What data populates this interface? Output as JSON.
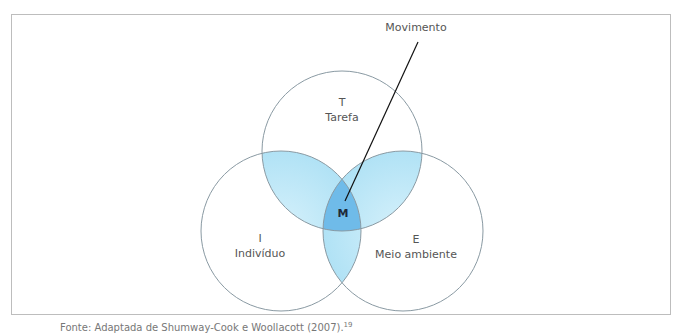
{
  "diagram": {
    "pointer_label": "Movimento",
    "center_label": "M",
    "circles": [
      {
        "id": "task",
        "letter": "T",
        "name": "Tarefa"
      },
      {
        "id": "individual",
        "letter": "I",
        "name": "Indivíduo"
      },
      {
        "id": "environment",
        "letter": "E",
        "name": "Meio ambiente"
      }
    ],
    "colors": {
      "circle_stroke": "#8a9aa3",
      "pair_overlap_fill": "#bfe8f7",
      "center_fill": "#6fbbe9",
      "pointer_line": "#111111"
    }
  },
  "caption": {
    "text": "Fonte: Adaptada de Shumway-Cook e Woollacott (2007).",
    "ref": "19"
  }
}
